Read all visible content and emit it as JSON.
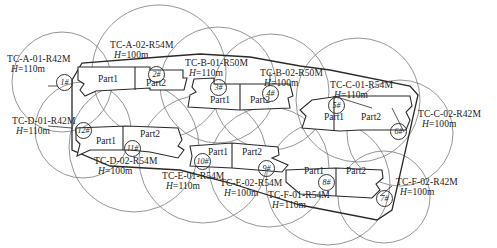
{
  "drawing": {
    "title": "Tower crane layout plan",
    "colors": {
      "line": "#2a2a2a",
      "circle": "#777777",
      "background": "#ffffff"
    }
  },
  "cranes": [
    {
      "id": "1#",
      "label": "TC-A-01-R42M",
      "height_prefix": "H",
      "height": "=110m"
    },
    {
      "id": "2#",
      "label": "TC-A-02-R54M",
      "height_prefix": "H",
      "height": "=100m"
    },
    {
      "id": "3#",
      "label": "TC-B-01-R50M",
      "height_prefix": "H",
      "height": "=110m"
    },
    {
      "id": "4#",
      "label": "TC-B-02-R50M",
      "height_prefix": "H",
      "height": "=100m"
    },
    {
      "id": "5#",
      "label": "TC-C-01-R54M",
      "height_prefix": "H",
      "height": "=110m"
    },
    {
      "id": "6#",
      "label": "TC-C-02-R42M",
      "height_prefix": "H",
      "height": "=100m"
    },
    {
      "id": "7#",
      "label": "TC-F-02-R42M",
      "height_prefix": "H",
      "height": "=100m"
    },
    {
      "id": "8#",
      "label": "TC-F-01-R54M",
      "height_prefix": "H",
      "height": "=110m"
    },
    {
      "id": "9#",
      "label": "TC-E-02-R54M",
      "height_prefix": "H",
      "height": "=100m"
    },
    {
      "id": "10#",
      "label": "TC-E-01-R54M",
      "height_prefix": "H",
      "height": "=110m"
    },
    {
      "id": "11#",
      "label": "TC-D-02-R54M",
      "height_prefix": "H",
      "height": "=100m"
    },
    {
      "id": "12#",
      "label": "TC-D-01-R42M",
      "height_prefix": "H",
      "height": "=110m"
    }
  ],
  "buildings": [
    {
      "name": "A",
      "parts": [
        "Part1",
        "Part2"
      ]
    },
    {
      "name": "B",
      "parts": [
        "Part1",
        "Part2"
      ]
    },
    {
      "name": "C",
      "parts": [
        "Part1",
        "Part2"
      ]
    },
    {
      "name": "D",
      "parts": [
        "Part1",
        "Part2"
      ]
    },
    {
      "name": "E",
      "parts": [
        "Part1",
        "Part2"
      ]
    },
    {
      "name": "F",
      "parts": [
        "Part1",
        "Part2"
      ]
    }
  ]
}
